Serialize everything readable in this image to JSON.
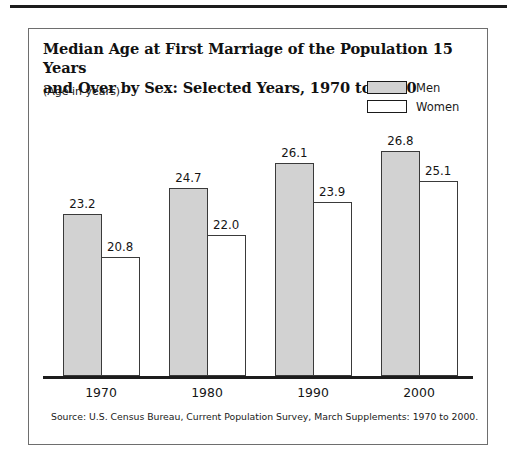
{
  "chart_data": {
    "type": "bar",
    "title": "Median Age at First Marriage of the Population 15 Years and Over by Sex:  Selected Years, 1970 to 2000",
    "title_line1": "Median Age at First Marriage of the Population 15 Years",
    "title_line2": "and Over by Sex:  Selected Years, 1970 to 2000",
    "subtitle": "(Age in years)",
    "xlabel": "",
    "ylabel": "",
    "grid": false,
    "legend_position": "top-right",
    "categories": [
      "1970",
      "1980",
      "1990",
      "2000"
    ],
    "series": [
      {
        "name": "Men",
        "color": "#d2d2d2",
        "values": [
          23.2,
          24.7,
          26.1,
          26.8
        ]
      },
      {
        "name": "Women",
        "color": "#ffffff",
        "values": [
          20.8,
          22.0,
          23.9,
          25.1
        ]
      }
    ],
    "value_labels": {
      "men": [
        "23.2",
        "24.7",
        "26.1",
        "26.8"
      ],
      "women": [
        "20.8",
        "22.0",
        "23.9",
        "25.1"
      ]
    },
    "ylim": [
      14.0,
      28.0
    ],
    "axis_note": "truncated vertical scale; no y-axis line or tick labels shown",
    "source": "Source: U.S. Census Bureau, Current Population Survey, March Supplements:  1970 to 2000."
  },
  "colors": {
    "men_fill": "#d2d2d2",
    "women_fill": "#ffffff",
    "bar_border": "#3a3a3a",
    "axis": "#1c1c1c",
    "card_border": "#6e6e6e",
    "text": "#1a1a1a"
  }
}
